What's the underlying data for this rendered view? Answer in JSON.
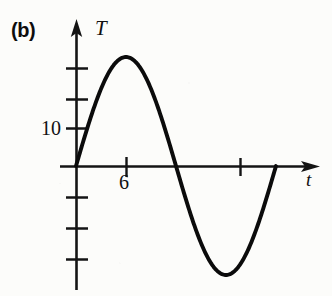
{
  "figure": {
    "panel_label": "(b)",
    "background_color": "#fcfcfa",
    "ink_color": "#111111"
  },
  "chart_data": {
    "type": "line",
    "title": "(b)",
    "xlabel": "t",
    "ylabel": "T",
    "grid": false,
    "legend": null,
    "x_axis": {
      "label": "t",
      "arrow": true,
      "tick_labels": [
        "6"
      ],
      "labeled_tick_values": [
        6
      ],
      "unlabeled_tick_values": [
        18
      ],
      "tick_positions_px": [
        126,
        240
      ],
      "axis_y_px": 166,
      "axis_start_px": 60,
      "axis_end_px": 320
    },
    "y_axis": {
      "label": "T",
      "arrow": true,
      "tick_labels": [
        "10"
      ],
      "labeled_tick_values": [
        10
      ],
      "tick_positions_px": [
        68,
        99,
        128,
        197,
        228,
        259
      ],
      "axis_x_px": 76,
      "axis_top_px": 22,
      "axis_bottom_px": 290
    },
    "series": [
      {
        "name": "T(t)",
        "form": "sine",
        "amplitude": 32,
        "period": 24,
        "phase": 0,
        "x": [
          0,
          1,
          2,
          3,
          4,
          5,
          6,
          7,
          8,
          9,
          10,
          11,
          12,
          13,
          14,
          15,
          16,
          17,
          18,
          19,
          20,
          21,
          22,
          23,
          24
        ],
        "y": [
          0,
          8.3,
          16.0,
          22.6,
          27.7,
          30.9,
          32.0,
          30.9,
          27.7,
          22.6,
          16.0,
          8.3,
          0,
          -8.3,
          -16.0,
          -22.6,
          -27.7,
          -30.9,
          -32.0,
          -30.9,
          -27.7,
          -22.6,
          -16.0,
          -8.3,
          0
        ]
      }
    ],
    "key_points": {
      "start": [
        0,
        0
      ],
      "maximum": [
        6,
        32
      ],
      "descending_zero": [
        12,
        0
      ],
      "minimum": [
        18,
        -32
      ],
      "ending_zero": [
        24,
        0
      ]
    },
    "xlim": [
      0,
      24
    ],
    "ylim": [
      -36,
      38
    ]
  }
}
